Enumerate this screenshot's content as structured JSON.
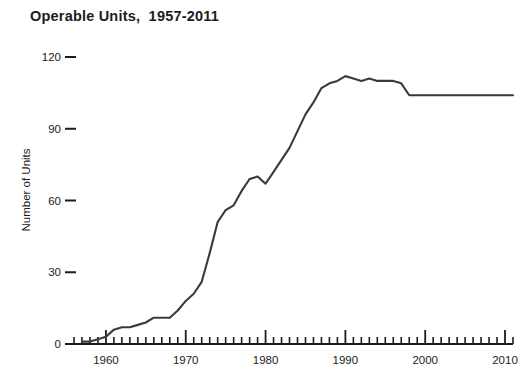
{
  "chart_data": {
    "type": "line",
    "title": "Operable Units,  1957-2011",
    "xlabel": "",
    "ylabel": "Number of Units",
    "xlim": [
      1956,
      2011
    ],
    "ylim": [
      0,
      120
    ],
    "grid": false,
    "legend": null,
    "x_ticks_major": [
      1960,
      1970,
      1980,
      1990,
      2000,
      2010
    ],
    "x_tick_labels": [
      "1960",
      "1970",
      "1980",
      "1990",
      "2000",
      "2010"
    ],
    "x_minor_tick_step": 1,
    "y_ticks": [
      0,
      30,
      60,
      90,
      120
    ],
    "y_tick_labels": [
      "0",
      "30",
      "60",
      "90",
      "120"
    ],
    "line_color": "#3a3a3a",
    "line_width": 2.1,
    "x": [
      1957,
      1958,
      1959,
      1960,
      1961,
      1962,
      1963,
      1964,
      1965,
      1966,
      1967,
      1968,
      1969,
      1970,
      1971,
      1972,
      1973,
      1974,
      1975,
      1976,
      1977,
      1978,
      1979,
      1980,
      1981,
      1982,
      1983,
      1984,
      1985,
      1986,
      1987,
      1988,
      1989,
      1990,
      1991,
      1992,
      1993,
      1994,
      1995,
      1996,
      1997,
      1998,
      1999,
      2000,
      2001,
      2002,
      2003,
      2004,
      2005,
      2006,
      2007,
      2008,
      2009,
      2010,
      2011
    ],
    "values": [
      1,
      1,
      2,
      3,
      6,
      7,
      7,
      8,
      9,
      11,
      11,
      11,
      14,
      18,
      21,
      26,
      38,
      51,
      56,
      58,
      64,
      69,
      70,
      67,
      72,
      77,
      82,
      89,
      96,
      101,
      107,
      109,
      110,
      112,
      111,
      110,
      111,
      110,
      110,
      110,
      109,
      104,
      104,
      104,
      104,
      104,
      104,
      104,
      104,
      104,
      104,
      104,
      104,
      104,
      104
    ]
  }
}
